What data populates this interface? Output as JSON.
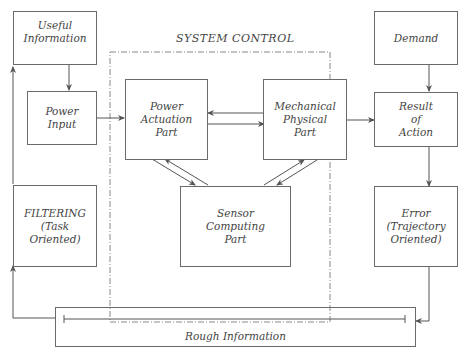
{
  "diagram": {
    "system_title": "SYSTEM CONTROL",
    "nodes": {
      "useful_information": "Useful\nInformation",
      "power_input": "Power\nInput",
      "filtering": "FILTERING\n(Task\nOriented)",
      "power_actuation": "Power\nActuation\nPart",
      "mechanical_physical": "Mechanical\nPhysical\nPart",
      "sensor_computing": "Sensor\nComputing\nPart",
      "demand": "Demand",
      "result_of_action": "Result\nof\nAction",
      "error": "Error\n(Trajectory\nOriented)",
      "rough_information": "Rough Information"
    },
    "edges": [
      {
        "from": "useful_information",
        "to": "power_input"
      },
      {
        "from": "power_input",
        "to": "power_actuation"
      },
      {
        "from": "mechanical_physical",
        "to": "power_actuation"
      },
      {
        "from": "power_actuation",
        "to": "mechanical_physical"
      },
      {
        "from": "power_actuation",
        "to": "sensor_computing"
      },
      {
        "from": "sensor_computing",
        "to": "power_actuation"
      },
      {
        "from": "mechanical_physical",
        "to": "sensor_computing"
      },
      {
        "from": "sensor_computing",
        "to": "mechanical_physical"
      },
      {
        "from": "mechanical_physical",
        "to": "result_of_action"
      },
      {
        "from": "demand",
        "to": "result_of_action"
      },
      {
        "from": "result_of_action",
        "to": "error"
      },
      {
        "from": "error",
        "to": "rough_information"
      },
      {
        "from": "rough_information",
        "to": "filtering"
      },
      {
        "from": "filtering",
        "to": "useful_information"
      }
    ],
    "colors": {
      "line": "#555555",
      "dashed": "#888888",
      "text": "#444444"
    }
  }
}
